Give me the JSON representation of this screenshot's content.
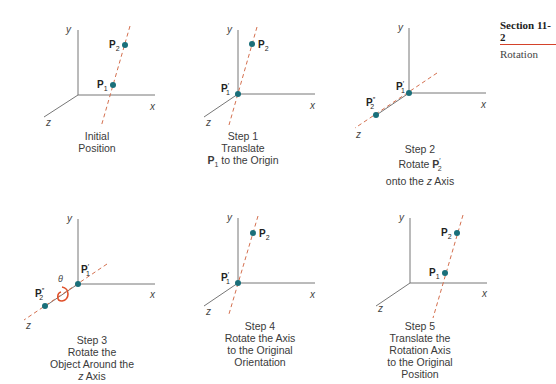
{
  "section": {
    "title": "Section 11-2",
    "subtitle": "Rotation",
    "accent": "#d4422a"
  },
  "colors": {
    "axis": "#777777",
    "rotation_axis": "#d4704f",
    "point": "#1a6f7a",
    "theta_arc": "#e0502a"
  },
  "axes_labels": {
    "x": "x",
    "y": "y",
    "z": "z"
  },
  "theta": "θ",
  "panels": [
    {
      "id": "initial",
      "caption": [
        "Initial",
        "Position"
      ],
      "points": [
        "P1",
        "P2"
      ]
    },
    {
      "id": "step1",
      "caption": [
        "Step 1",
        "Translate",
        "P1 to the Origin"
      ],
      "points": [
        "P1'",
        "P2"
      ]
    },
    {
      "id": "step2",
      "caption": [
        "Step 2",
        "Rotate P2'",
        "onto the z Axis"
      ],
      "points": [
        "P1'",
        "P2''"
      ]
    },
    {
      "id": "step3",
      "caption": [
        "Step 3",
        "Rotate the",
        "Object Around the",
        "z Axis"
      ],
      "points": [
        "P1'",
        "P2''"
      ]
    },
    {
      "id": "step4",
      "caption": [
        "Step 4",
        "Rotate the Axis",
        "to the Original",
        "Orientation"
      ],
      "points": [
        "P1'",
        "P2"
      ]
    },
    {
      "id": "step5",
      "caption": [
        "Step 5",
        "Translate the",
        "Rotation Axis",
        "to the Original",
        "Position"
      ],
      "points": [
        "P1",
        "P2"
      ]
    }
  ]
}
